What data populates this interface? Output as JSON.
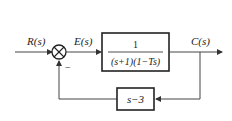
{
  "diagram": {
    "type": "block-diagram",
    "signals": {
      "input": "R(s)",
      "error": "E(s)",
      "output": "C(s)"
    },
    "summing_junction": {
      "feedback_sign": "−"
    },
    "forward_block": {
      "numerator": "1",
      "denominator": "(s+1)(1−Ts)"
    },
    "feedback_block": {
      "transfer": "s−3"
    }
  }
}
